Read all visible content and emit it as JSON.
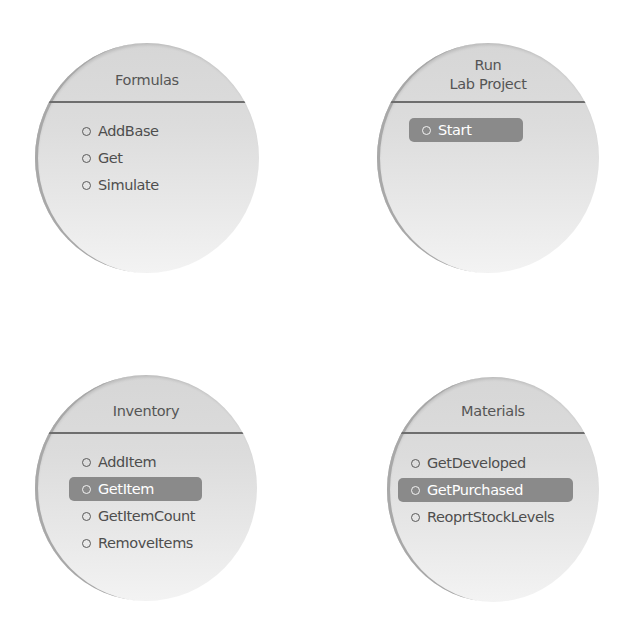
{
  "panels": [
    {
      "title_lines": [
        "Formulas"
      ],
      "items": [
        {
          "label": "AddBase",
          "selected": false
        },
        {
          "label": "Get",
          "selected": false
        },
        {
          "label": "Simulate",
          "selected": false
        }
      ]
    },
    {
      "title_lines": [
        "Run",
        "Lab Project"
      ],
      "items": [
        {
          "label": "Start",
          "selected": true
        }
      ]
    },
    {
      "title_lines": [
        "Inventory"
      ],
      "items": [
        {
          "label": "AddItem",
          "selected": false
        },
        {
          "label": "GetItem",
          "selected": true
        },
        {
          "label": "GetItemCount",
          "selected": false
        },
        {
          "label": "RemoveItems",
          "selected": false
        }
      ]
    },
    {
      "title_lines": [
        "Materials"
      ],
      "items": [
        {
          "label": "GetDeveloped",
          "selected": false
        },
        {
          "label": "GetPurchased",
          "selected": true
        },
        {
          "label": "ReoprtStockLevels",
          "selected": false
        }
      ]
    }
  ],
  "colors": {
    "disc_fill": "#dcdcdc",
    "divider": "#6e6e6e",
    "selected_fill": "#8a8a8a",
    "text": "#4e4e4e"
  }
}
